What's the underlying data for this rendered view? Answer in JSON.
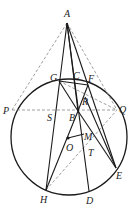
{
  "diagram": {
    "type": "geometry",
    "colors": {
      "stroke": "#1a1a1a",
      "dashed": "#777777",
      "background": "#ffffff"
    },
    "circle": {
      "center": "O",
      "cx": 69,
      "cy": 137,
      "r": 58
    },
    "points": {
      "A": {
        "x": 67,
        "y": 23,
        "label": "A",
        "lx": 64,
        "ly": 17
      },
      "G": {
        "x": 59,
        "y": 81,
        "label": "G",
        "lx": 50,
        "ly": 81
      },
      "C": {
        "x": 77,
        "y": 80,
        "label": "C",
        "lx": 73,
        "ly": 79
      },
      "F": {
        "x": 88,
        "y": 85,
        "label": "F",
        "lx": 88,
        "ly": 82
      },
      "R": {
        "x": 85,
        "y": 97,
        "label": "R",
        "lx": 82,
        "ly": 105
      },
      "P": {
        "x": 12,
        "y": 110,
        "label": "P",
        "lx": 3,
        "ly": 114
      },
      "Q": {
        "x": 117,
        "y": 110,
        "label": "Q",
        "lx": 119,
        "ly": 113
      },
      "S": {
        "x": 53,
        "y": 110,
        "label": "S",
        "lx": 47,
        "ly": 121
      },
      "B": {
        "x": 78,
        "y": 111,
        "label": "B",
        "lx": 69,
        "ly": 121
      },
      "O": {
        "x": 68,
        "y": 138,
        "label": "O",
        "lx": 66,
        "ly": 151
      },
      "M": {
        "x": 84,
        "y": 134,
        "label": "M",
        "lx": 84,
        "ly": 140
      },
      "T": {
        "x": 89,
        "y": 150,
        "label": "T",
        "lx": 88,
        "ly": 156
      },
      "H": {
        "x": 46,
        "y": 190,
        "label": "H",
        "lx": 40,
        "ly": 203
      },
      "D": {
        "x": 89,
        "y": 191,
        "label": "D",
        "lx": 86,
        "ly": 204
      },
      "E": {
        "x": 116,
        "y": 168,
        "label": "E",
        "lx": 116,
        "ly": 179
      }
    },
    "solid_segments": [
      [
        "A",
        "H"
      ],
      [
        "A",
        "D"
      ],
      [
        "A",
        "E"
      ],
      [
        "A",
        "B"
      ],
      [
        "G",
        "B"
      ],
      [
        "B",
        "F"
      ],
      [
        "G",
        "F"
      ],
      [
        "H",
        "B"
      ],
      [
        "B",
        "E"
      ],
      [
        "R",
        "E"
      ],
      [
        "O",
        "M"
      ]
    ],
    "dashed_segments": [
      [
        "A",
        "P"
      ],
      [
        "A",
        "Q"
      ],
      [
        "P",
        "Q"
      ],
      [
        "G",
        "Q"
      ],
      [
        "H",
        "Q"
      ]
    ]
  }
}
